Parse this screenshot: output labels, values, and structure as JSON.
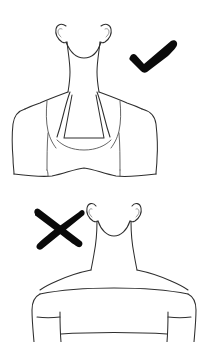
{
  "page": {
    "title": "Neckline Comparison Illustration",
    "background_color": "#ffffff",
    "width": 200,
    "height": 342,
    "line_color": "#2e2e2e",
    "mark_color": "#0a0a0a",
    "style": "hand-drawn fashion line illustration, no text labels"
  },
  "figures": [
    {
      "id": "recommended",
      "position": "top",
      "subject": "female head, neck, shoulders and torso in line-art outline",
      "garment": "halter neck top with trapezoidal bodice and cap sleeves",
      "neckline": "halter",
      "verdict": "recommended",
      "mark": {
        "name": "checkmark",
        "symbol": "check",
        "color": "#0a0a0a",
        "x": 128,
        "y": 40,
        "width": 50,
        "height": 33
      }
    },
    {
      "id": "not-recommended",
      "position": "bottom",
      "subject": "female head, neck, shoulders and torso in line-art outline",
      "garment": "off-shoulder boat neck top with short sleeves and cuffs",
      "neckline": "boat neck / off-shoulder",
      "verdict": "not recommended",
      "mark": {
        "name": "cross",
        "symbol": "x",
        "color": "#0a0a0a",
        "x": 33,
        "y": 209,
        "width": 50,
        "height": 41
      }
    }
  ]
}
